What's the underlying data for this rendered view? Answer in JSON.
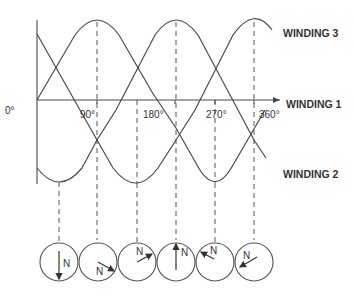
{
  "diagram": {
    "type": "three-phase-winding-waveforms",
    "axis": {
      "origin_label": "0°",
      "ticks": [
        "90°",
        "180°",
        "270°",
        "360°"
      ]
    },
    "windings": [
      {
        "id": "winding1",
        "label": "WINDING 1"
      },
      {
        "id": "winding2",
        "label": "WINDING 2"
      },
      {
        "id": "winding3",
        "label": "WINDING 3"
      }
    ],
    "rotor_positions": [
      {
        "pole_label": "N",
        "arrow_direction": "down"
      },
      {
        "pole_label": "N",
        "arrow_direction": "down-right"
      },
      {
        "pole_label": "N",
        "arrow_direction": "up-right"
      },
      {
        "pole_label": "N",
        "arrow_direction": "up"
      },
      {
        "pole_label": "N",
        "arrow_direction": "up-left"
      },
      {
        "pole_label": "N",
        "arrow_direction": "down-left"
      }
    ],
    "colors": {
      "line": "#4a4a4a",
      "text": "#333333",
      "background": "#ffffff"
    }
  }
}
